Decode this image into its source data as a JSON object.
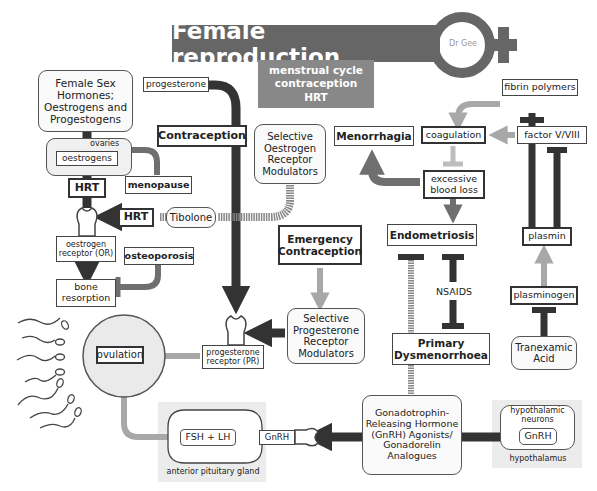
{
  "title": {
    "main": "Female reproduction",
    "subtitle_lines": [
      "menstrual cycle",
      "contraception",
      "HRT"
    ],
    "logo_text": "Dr Gee"
  },
  "nodes": {
    "female_sex_hormones": "Female Sex Hormones; Oestrogens and Progestogens",
    "progesterone": "progesterone",
    "ovaries": "ovaries",
    "oestrogens": "oestrogens",
    "menopause": "menopause",
    "hrt_top": "HRT",
    "hrt_side": "HRT",
    "tibolone": "Tibolone",
    "oestrogen_receptor": "oestrogen receptor (OR)",
    "osteoporosis": "osteoporosis",
    "bone_resorption": "bone resorption",
    "contraception": "Contraception",
    "serm": "Selective Oestrogen Receptor Modulators",
    "emergency_contraception": "Emergency Contraception",
    "sprm": "Selective Progesterone Receptor Modulators",
    "progesterone_receptor": "progesterone receptor (PR)",
    "ovulation": "ovulation",
    "fsh_lh": "FSH + LH",
    "anterior_pituitary": "anterior pituitary gland",
    "gnrh_left": "GnRH",
    "gnrh_agonists": "Gonadotrophin-Releasing Hormone (GnRH) Agonists/ Gonadorelin Analogues",
    "hypothalamic_neurons": "hypothalamic neurons",
    "gnrh_right": "GnRH",
    "hypothalamus": "hypothalamus",
    "menorrhagia": "Menorrhagia",
    "coagulation": "coagulation",
    "excessive_blood_loss": "excessive blood loss",
    "endometriosis": "Endometriosis",
    "nsaids": "NSAIDS",
    "primary_dysmenorrhoea": "Primary Dysmenorrhoea",
    "fibrin_polymers": "fibrin polymers",
    "factor_v_viii": "factor V/VIII",
    "plasmin": "plasmin",
    "plasminogen": "plasminogen",
    "tranexamic_acid": "Tranexamic Acid"
  },
  "colors": {
    "dark": "#333333",
    "mid": "#6f6f6f",
    "light": "#a8a8a8",
    "title_bg": "#666666",
    "subtitle_bg": "#888888"
  }
}
